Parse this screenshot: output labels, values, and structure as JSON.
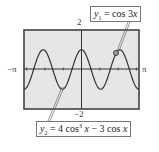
{
  "chart_data": {
    "type": "line",
    "title": "",
    "xlabel": "",
    "ylabel": "",
    "xlim": [
      -3.14159,
      3.14159
    ],
    "ylim": [
      -2,
      2
    ],
    "x_tick_labels": {
      "left": "−π",
      "right": "π"
    },
    "y_tick_labels": {
      "top": "2",
      "bottom": "−2"
    },
    "grid": false,
    "background": "#e6e6e6",
    "series": [
      {
        "name": "y1",
        "label": "y1 = cos 3x",
        "expression": "cos(3x)",
        "x": [
          -3.1416,
          -2.618,
          -2.0944,
          -1.5708,
          -1.0472,
          -0.5236,
          0,
          0.5236,
          1.0472,
          1.5708,
          2.0944,
          2.618,
          3.1416
        ],
        "values": [
          -1,
          0,
          1,
          0,
          -1,
          0,
          1,
          0,
          -1,
          0,
          1,
          0,
          -1
        ]
      },
      {
        "name": "y2",
        "label": "y2 = 4 cos³x − 3 cos x",
        "expression": "4cos^3(x) - 3cos(x)",
        "x": [
          -3.1416,
          -2.618,
          -2.0944,
          -1.5708,
          -1.0472,
          -0.5236,
          0,
          0.5236,
          1.0472,
          1.5708,
          2.0944,
          2.618,
          3.1416
        ],
        "values": [
          -1,
          0,
          1,
          0,
          -1,
          0,
          1,
          0,
          -1,
          0,
          1,
          0,
          -1
        ]
      }
    ],
    "annotations": [
      {
        "text": "y1 = cos 3x",
        "points_to": [
          1.9,
          0.95
        ]
      },
      {
        "text": "y2 = 4 cos³ x − 3 cos x",
        "points_to": [
          -1.1,
          -1.0
        ]
      }
    ]
  },
  "labels": {
    "x_min": "−π",
    "x_max": "π",
    "y_max": "2",
    "y_min": "−2"
  },
  "legend": {
    "y1": {
      "var": "y",
      "sub": "1",
      "rhs": " = cos 3",
      "x": "x"
    },
    "y2": {
      "var": "y",
      "sub": "2",
      "rhs1": " = 4 cos",
      "pow": "3",
      "rhs2": " ",
      "x1": "x",
      "rhs3": " − 3 cos ",
      "x2": "x"
    }
  }
}
